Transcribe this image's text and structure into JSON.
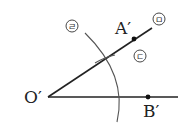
{
  "diagram": {
    "type": "geometric-construction",
    "points": {
      "O": {
        "label": "O′",
        "x": 48,
        "y": 97
      },
      "A": {
        "label": "A′",
        "x": 134,
        "y": 39
      },
      "B": {
        "label": "B′",
        "x": 148,
        "y": 97
      }
    },
    "step_labels": {
      "arc_large": "ㄹ",
      "arc_small": "ㄷ",
      "ray_upper": "ㅁ"
    },
    "colors": {
      "line": "#222222",
      "arc": "#555555",
      "background": "#ffffff"
    }
  }
}
